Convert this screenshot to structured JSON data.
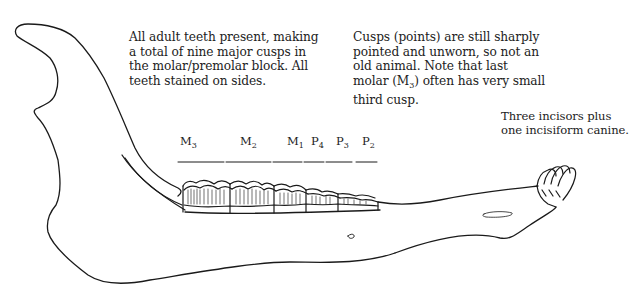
{
  "diagram": {
    "stroke_color": "#1a1a1a",
    "background": "#ffffff"
  },
  "annotations": {
    "teeth_present": {
      "lines": [
        "All adult teeth present, making",
        "a total of nine major cusps in",
        "the molar/premolar block. All",
        "teeth stained on sides."
      ]
    },
    "cusps": {
      "lines": [
        "Cusps (points) are still sharply",
        "pointed and unworn, so not an",
        "old animal. Note that last"
      ],
      "line4_prefix": "molar (M",
      "line4_sub": "3",
      "line4_suffix": ") often has very small",
      "line5": "third cusp."
    },
    "incisors": {
      "lines": [
        "Three incisors plus",
        "one incisiform canine."
      ]
    }
  },
  "tooth_labels": [
    {
      "letter": "M",
      "sub": "3",
      "x": 180
    },
    {
      "letter": "M",
      "sub": "2",
      "x": 240
    },
    {
      "letter": "M",
      "sub": "1",
      "x": 287
    },
    {
      "letter": "P",
      "sub": "4",
      "x": 311
    },
    {
      "letter": "P",
      "sub": "3",
      "x": 336
    },
    {
      "letter": "P",
      "sub": "2",
      "x": 362
    }
  ]
}
